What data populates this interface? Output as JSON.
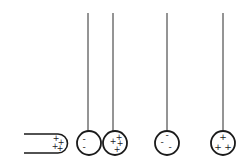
{
  "diagram": {
    "title": "",
    "colors": {
      "stroke": "#1a1a1a",
      "background": "#ffffff"
    },
    "rod": {
      "charge_signs": [
        "+",
        "+",
        "+",
        "+"
      ]
    },
    "balls": [
      {
        "id": "ball-1",
        "thread_x": 88,
        "charges": [
          "-",
          "-"
        ],
        "label": "negative-near-rod"
      },
      {
        "id": "ball-2",
        "thread_x": 113,
        "charges": [
          "+",
          "+",
          "+",
          "+"
        ],
        "label": "positive"
      },
      {
        "id": "ball-3",
        "thread_x": 167,
        "charges": [
          "-",
          "-",
          "-"
        ],
        "label": "negative"
      },
      {
        "id": "ball-4",
        "thread_x": 223,
        "charges": [
          "+",
          "+",
          "+"
        ],
        "label": "positive"
      }
    ]
  }
}
